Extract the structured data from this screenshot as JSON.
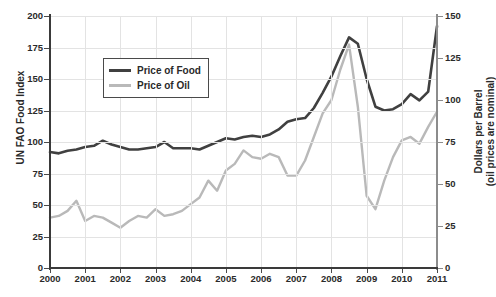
{
  "chart_data": {
    "type": "line",
    "title": "",
    "xlabel": "",
    "ylabel": "UN FAO Food Index",
    "y2label": "Dollars per Barrel",
    "y2label_sub": "(oil prices are nominal)",
    "grid": true,
    "legend_position": "upper-left-inside",
    "xlim": [
      2000,
      2011
    ],
    "ylim": [
      0,
      200
    ],
    "y2lim": [
      0,
      150
    ],
    "xticks": [
      "2000",
      "2001",
      "2002",
      "2003",
      "2004",
      "2005",
      "2006",
      "2007",
      "2008",
      "2009",
      "2010",
      "2011"
    ],
    "yticks": [
      "0",
      "25",
      "50",
      "75",
      "100",
      "125",
      "150",
      "175",
      "200"
    ],
    "y2ticks": [
      "0",
      "25",
      "50",
      "75",
      "100",
      "125",
      "150"
    ],
    "series": [
      {
        "name": "Price of Food",
        "color": "#404040",
        "axis": "left",
        "units": "UN FAO Food Index",
        "x": [
          2000.0,
          2000.25,
          2000.5,
          2000.75,
          2001.0,
          2001.25,
          2001.5,
          2001.75,
          2002.0,
          2002.25,
          2002.5,
          2002.75,
          2003.0,
          2003.25,
          2003.5,
          2003.75,
          2004.0,
          2004.25,
          2004.5,
          2004.75,
          2005.0,
          2005.25,
          2005.5,
          2005.75,
          2006.0,
          2006.25,
          2006.5,
          2006.75,
          2007.0,
          2007.25,
          2007.5,
          2007.75,
          2008.0,
          2008.25,
          2008.5,
          2008.75,
          2009.0,
          2009.25,
          2009.5,
          2009.75,
          2010.0,
          2010.25,
          2010.5,
          2010.75,
          2011.0
        ],
        "values": [
          92,
          91,
          93,
          94,
          96,
          97,
          101,
          98,
          96,
          94,
          94,
          95,
          96,
          100,
          95,
          95,
          95,
          94,
          97,
          100,
          103,
          102,
          104,
          105,
          104,
          106,
          110,
          116,
          118,
          119,
          127,
          139,
          152,
          168,
          183,
          178,
          150,
          128,
          125,
          126,
          130,
          138,
          133,
          140,
          192
        ]
      },
      {
        "name": "Price of Oil",
        "color": "#b9b9b9",
        "axis": "right",
        "units": "Dollars per Barrel",
        "x": [
          2000.0,
          2000.25,
          2000.5,
          2000.75,
          2001.0,
          2001.25,
          2001.5,
          2001.75,
          2002.0,
          2002.25,
          2002.5,
          2002.75,
          2003.0,
          2003.25,
          2003.5,
          2003.75,
          2004.0,
          2004.25,
          2004.5,
          2004.75,
          2005.0,
          2005.25,
          2005.5,
          2005.75,
          2006.0,
          2006.25,
          2006.5,
          2006.75,
          2007.0,
          2007.25,
          2007.5,
          2007.75,
          2008.0,
          2008.25,
          2008.5,
          2008.75,
          2009.0,
          2009.25,
          2009.5,
          2009.75,
          2010.0,
          2010.25,
          2010.5,
          2010.75,
          2011.0
        ],
        "values": [
          30,
          31,
          34,
          40,
          28,
          31,
          30,
          27,
          24,
          28,
          31,
          30,
          35,
          31,
          32,
          34,
          38,
          42,
          52,
          46,
          58,
          62,
          70,
          66,
          65,
          68,
          66,
          55,
          55,
          64,
          78,
          92,
          100,
          118,
          133,
          96,
          43,
          35,
          52,
          66,
          76,
          78,
          74,
          84,
          93
        ]
      }
    ],
    "legend": [
      {
        "label": "Price of Food",
        "color": "#404040"
      },
      {
        "label": "Price of Oil",
        "color": "#b9b9b9"
      }
    ]
  }
}
